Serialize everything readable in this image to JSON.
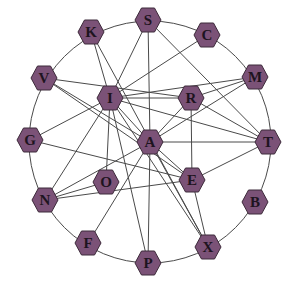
{
  "diagram": {
    "type": "graph",
    "layout": "circular",
    "ring": {
      "cx": 150,
      "cy": 142,
      "r": 121
    },
    "colors": {
      "node_fill": "#7b5277",
      "node_stroke": "#3d2a3a",
      "edge": "#4a4a4a",
      "label": "#1e1420"
    },
    "nodes": [
      {
        "id": "S",
        "label": "S",
        "x": 148,
        "y": 20
      },
      {
        "id": "C",
        "label": "C",
        "x": 207,
        "y": 35
      },
      {
        "id": "M",
        "label": "M",
        "x": 255,
        "y": 77
      },
      {
        "id": "T",
        "label": "T",
        "x": 268,
        "y": 142
      },
      {
        "id": "B",
        "label": "B",
        "x": 255,
        "y": 202
      },
      {
        "id": "X",
        "label": "X",
        "x": 208,
        "y": 247
      },
      {
        "id": "P",
        "label": "P",
        "x": 148,
        "y": 263
      },
      {
        "id": "F",
        "label": "F",
        "x": 88,
        "y": 243
      },
      {
        "id": "N",
        "label": "N",
        "x": 45,
        "y": 200
      },
      {
        "id": "G",
        "label": "G",
        "x": 30,
        "y": 140
      },
      {
        "id": "V",
        "label": "V",
        "x": 44,
        "y": 78
      },
      {
        "id": "K",
        "label": "K",
        "x": 91,
        "y": 32
      },
      {
        "id": "I",
        "label": "I",
        "x": 110,
        "y": 98
      },
      {
        "id": "R",
        "label": "R",
        "x": 191,
        "y": 98
      },
      {
        "id": "A",
        "label": "A",
        "x": 150,
        "y": 142
      },
      {
        "id": "O",
        "label": "O",
        "x": 106,
        "y": 182
      },
      {
        "id": "E",
        "label": "E",
        "x": 192,
        "y": 180
      }
    ],
    "edges": [
      [
        "I",
        "K"
      ],
      [
        "I",
        "S"
      ],
      [
        "I",
        "C"
      ],
      [
        "I",
        "M"
      ],
      [
        "I",
        "R"
      ],
      [
        "I",
        "T"
      ],
      [
        "I",
        "A"
      ],
      [
        "I",
        "X"
      ],
      [
        "I",
        "P"
      ],
      [
        "I",
        "O"
      ],
      [
        "I",
        "G"
      ],
      [
        "I",
        "N"
      ],
      [
        "V",
        "R"
      ],
      [
        "V",
        "A"
      ],
      [
        "V",
        "E"
      ],
      [
        "K",
        "X"
      ],
      [
        "S",
        "A"
      ],
      [
        "S",
        "T"
      ],
      [
        "M",
        "R"
      ],
      [
        "M",
        "A"
      ],
      [
        "R",
        "T"
      ],
      [
        "R",
        "A"
      ],
      [
        "R",
        "E"
      ],
      [
        "A",
        "T"
      ],
      [
        "A",
        "P"
      ],
      [
        "A",
        "X"
      ],
      [
        "A",
        "F"
      ],
      [
        "A",
        "N"
      ],
      [
        "A",
        "E"
      ],
      [
        "G",
        "E"
      ],
      [
        "N",
        "O"
      ],
      [
        "N",
        "E"
      ],
      [
        "E",
        "T"
      ],
      [
        "E",
        "X"
      ]
    ]
  }
}
